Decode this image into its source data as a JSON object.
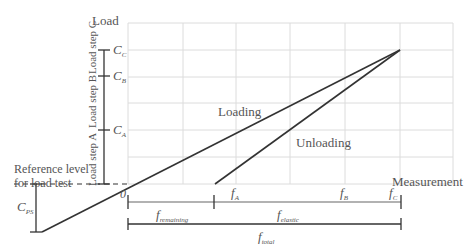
{
  "diagram": {
    "axis_y_label": "Load",
    "axis_x_label": "Measurement",
    "origin_label": "0",
    "reference_label_line1": "Reference level",
    "reference_label_line2": "for load test",
    "curve_loading": "Loading",
    "curve_unloading": "Unloading",
    "load_steps": [
      "Load step A",
      "Load step B",
      "Load step C"
    ],
    "load_levels": [
      {
        "main": "C",
        "sub": "C"
      },
      {
        "main": "C",
        "sub": "B"
      },
      {
        "main": "C",
        "sub": "A"
      }
    ],
    "preset_label": {
      "main": "C",
      "sub": "PS"
    },
    "measurements": [
      {
        "main": "f",
        "sub": "A"
      },
      {
        "main": "f",
        "sub": "B"
      },
      {
        "main": "f",
        "sub": "C"
      }
    ],
    "dimensions": [
      {
        "main": "f",
        "sub": "remaining"
      },
      {
        "main": "f",
        "sub": "elastic"
      },
      {
        "main": "f",
        "sub": "total"
      }
    ],
    "colors": {
      "line": "#333333",
      "grid": "#dddddd",
      "text": "#555555"
    }
  }
}
